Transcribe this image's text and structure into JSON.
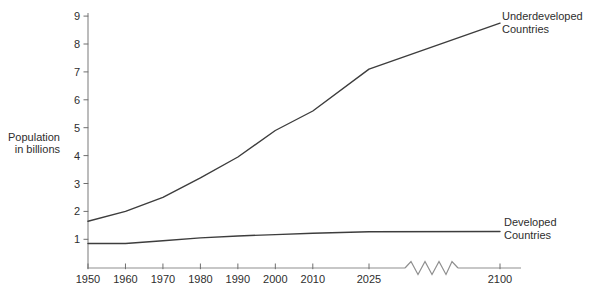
{
  "chart": {
    "y_axis_title": "Population\nin billions",
    "series_labels": {
      "underdeveloped": "Underdeveloped\nCountries",
      "developed": "Developed\nCountries"
    }
  },
  "chart_data": {
    "type": "line",
    "title": "",
    "xlabel": "",
    "ylabel": "Population in billions",
    "x_ticks": [
      1950,
      1960,
      1970,
      1980,
      1990,
      2000,
      2010,
      2025,
      2100
    ],
    "y_ticks": [
      1,
      2,
      3,
      4,
      5,
      6,
      7,
      8,
      9
    ],
    "ylim": [
      0,
      9
    ],
    "grid": false,
    "x_axis_break_between": [
      2025,
      2100
    ],
    "legend_position": "labels-at-line-ends-right",
    "series": [
      {
        "name": "Underdeveloped Countries",
        "x": [
          1950,
          1960,
          1970,
          1980,
          1990,
          2000,
          2010,
          2025,
          2100
        ],
        "values": [
          1.65,
          2.0,
          2.5,
          3.2,
          3.95,
          4.9,
          5.6,
          7.1,
          8.75
        ]
      },
      {
        "name": "Developed Countries",
        "x": [
          1950,
          1960,
          1970,
          1980,
          1990,
          2000,
          2010,
          2025,
          2100
        ],
        "values": [
          0.85,
          0.85,
          0.95,
          1.05,
          1.12,
          1.17,
          1.22,
          1.27,
          1.28
        ]
      }
    ],
    "colors": {
      "line": "#3d3d3d",
      "axis": "#8f8f8f",
      "tick": "#6e6e6e",
      "text": "#2e2e2e"
    }
  }
}
